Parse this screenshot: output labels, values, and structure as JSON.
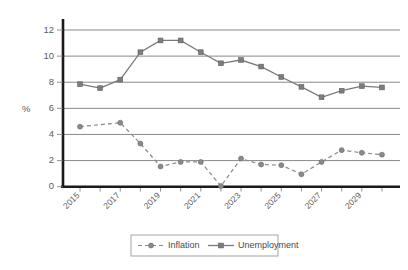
{
  "chart_data": {
    "type": "line",
    "title": "",
    "xlabel": "",
    "ylabel": "%",
    "ylim": [
      0,
      12
    ],
    "yticks": [
      0,
      2,
      4,
      6,
      8,
      10,
      12
    ],
    "ytick_labels": [
      "0",
      "2",
      "4",
      "6",
      "8",
      "10",
      "12"
    ],
    "grid": true,
    "legend_position": "bottom",
    "x": [
      2015,
      2016,
      2017,
      2018,
      2019,
      2020,
      2021,
      2022,
      2023,
      2024,
      2025,
      2026,
      2027,
      2028,
      2029,
      2030
    ],
    "xtick_labels": [
      "2015",
      "",
      "2017",
      "",
      "2019",
      "",
      "2021",
      "",
      "2023",
      "",
      "2025",
      "",
      "2027",
      "",
      "2029",
      ""
    ],
    "xtick_labels_shown": [
      "2015",
      "2017",
      "2019",
      "2021",
      "2023",
      "2025",
      "2027",
      "2029"
    ],
    "series": [
      {
        "name": "Inflation",
        "marker": "circle",
        "linestyle": "dashed",
        "color": "#8a8a8a",
        "values": [
          4.6,
          null,
          4.9,
          3.3,
          1.55,
          1.9,
          1.9,
          0.05,
          2.15,
          1.7,
          1.65,
          0.95,
          1.9,
          2.8,
          2.6,
          2.45
        ]
      },
      {
        "name": "Unemployment",
        "marker": "square",
        "linestyle": "solid",
        "color": "#7a7a7a",
        "values": [
          7.85,
          7.55,
          8.2,
          10.3,
          11.2,
          11.2,
          10.3,
          9.45,
          9.7,
          9.2,
          8.4,
          7.65,
          6.85,
          7.35,
          7.7,
          7.6
        ]
      }
    ]
  },
  "legend": {
    "items": [
      {
        "label": "Inflation"
      },
      {
        "label": "Unemployment"
      }
    ]
  },
  "axes": {
    "y_title": "%"
  }
}
